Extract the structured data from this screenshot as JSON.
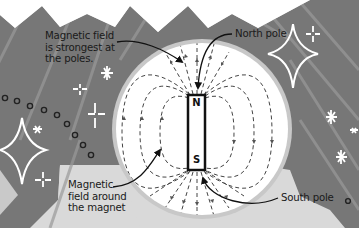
{
  "diagram": {
    "magnet": {
      "north_label": "N",
      "south_label": "S"
    },
    "annotations": {
      "strongest_line1": "Magnetic field",
      "strongest_line2": "is strongest at",
      "strongest_line3": "the poles.",
      "north_pole": "North pole",
      "field_line1": "Magnetic",
      "field_line2": "field around",
      "field_line3": "the magnet",
      "south_pole": "South pole"
    },
    "colors": {
      "background_light": "#d9d9d9",
      "background_dark": "#757575",
      "circle_fill": "#ffffff",
      "circle_ring": "#c8c8c8",
      "ink": "#1a1a1a",
      "decor": "#ffffff"
    }
  }
}
